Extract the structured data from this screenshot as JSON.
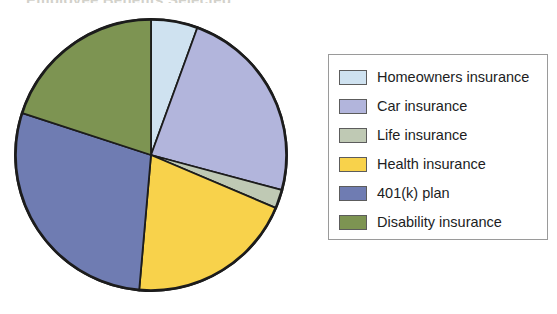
{
  "title_remnant": "Employee Benefits Selected",
  "legend": {
    "entries": [
      {
        "label": "Homeowners insurance",
        "color": "#cfe2f0"
      },
      {
        "label": "Car insurance",
        "color": "#b2b5dc"
      },
      {
        "label": "Life insurance",
        "color": "#bfc9b4"
      },
      {
        "label": "Health insurance",
        "color": "#f8d24b"
      },
      {
        "label": "401(k) plan",
        "color": "#6f7cb2"
      },
      {
        "label": "Disability insurance",
        "color": "#7d9452"
      }
    ]
  },
  "chart_data": {
    "type": "pie",
    "title": "",
    "legend_position": "right",
    "start_angle_deg": 0,
    "direction": "clockwise",
    "outline_color": "#1c1c1c",
    "categories": [
      "Homeowners insurance",
      "Car insurance",
      "Life insurance",
      "Health insurance",
      "401(k) plan",
      "Disability insurance"
    ],
    "colors": [
      "#cfe2f0",
      "#b2b5dc",
      "#bfc9b4",
      "#f8d24b",
      "#6f7cb2",
      "#7d9452"
    ],
    "values": [
      5.6,
      23.6,
      2.2,
      20.0,
      28.6,
      20.0
    ],
    "angles_deg": [
      20,
      85,
      8,
      72,
      103,
      72
    ],
    "units": "percent"
  }
}
